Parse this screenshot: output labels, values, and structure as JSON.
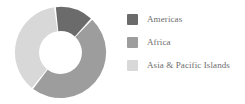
{
  "chart_data": {
    "type": "pie",
    "variant": "donut",
    "title": "",
    "subtitle": "",
    "xlabel": "",
    "ylabel": "",
    "grid": false,
    "legend_position": "right",
    "categories": [
      "Americas",
      "Africa",
      "Asia & Pacific Islands"
    ],
    "values": [
      14,
      48,
      38
    ],
    "value_unit": "percent",
    "colors": [
      "#6b6b6b",
      "#9d9d9d",
      "#d8d8d8"
    ],
    "slices": [
      {
        "label": "Americas",
        "value": 14,
        "color": "#6b6b6b",
        "start_angle": 353,
        "end_angle": 43
      },
      {
        "label": "Africa",
        "value": 48,
        "color": "#9d9d9d",
        "start_angle": 43,
        "end_angle": 218
      },
      {
        "label": "Asia & Pacific Islands",
        "value": 38,
        "color": "#d8d8d8",
        "start_angle": 218,
        "end_angle": 353
      }
    ],
    "inner_radius_ratio": 0.47
  },
  "legend": {
    "items": [
      {
        "label": "Americas",
        "color": "#6b6b6b"
      },
      {
        "label": "Africa",
        "color": "#9d9d9d"
      },
      {
        "label": "Asia & Pacific Islands",
        "color": "#d8d8d8"
      }
    ]
  },
  "canvas": {
    "background": "#ffffff",
    "text_color": "#6d6d6d"
  }
}
